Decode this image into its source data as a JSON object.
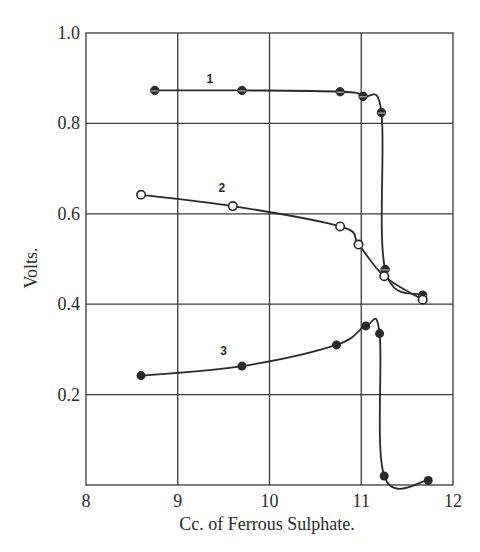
{
  "chart_data": {
    "type": "line",
    "title": "",
    "xlabel": "Cc. of Ferrous Sulphate.",
    "ylabel": "Volts.",
    "xlim": [
      8,
      12
    ],
    "ylim": [
      0,
      1.0
    ],
    "grid": true,
    "legend": "none (curves labelled inline 1, 2, 3)",
    "x_ticks": [
      "8",
      "9",
      "10",
      "11",
      "12"
    ],
    "y_ticks": [
      "0.2",
      "0.4",
      "0.6",
      "0.8",
      "1.0"
    ],
    "series": [
      {
        "name": "1",
        "marker": "half-filled circle",
        "x": [
          8.75,
          9.7,
          10.77,
          11.02,
          11.22,
          11.26,
          11.67
        ],
        "y": [
          0.873,
          0.873,
          0.87,
          0.86,
          0.824,
          0.477,
          0.42
        ]
      },
      {
        "name": "2",
        "marker": "open circle",
        "x": [
          8.6,
          9.6,
          10.77,
          10.97,
          11.25,
          11.67
        ],
        "y": [
          0.642,
          0.617,
          0.572,
          0.532,
          0.462,
          0.41
        ]
      },
      {
        "name": "3",
        "marker": "filled circle",
        "x": [
          8.6,
          9.7,
          10.73,
          11.05,
          11.2,
          11.25,
          11.73
        ],
        "y": [
          0.242,
          0.263,
          0.31,
          0.352,
          0.335,
          0.02,
          0.01
        ]
      }
    ]
  }
}
